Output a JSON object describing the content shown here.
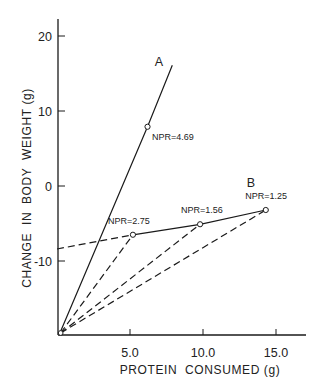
{
  "chart_data": {
    "type": "line",
    "title": "",
    "xlabel": "PROTEIN  CONSUMED (g)",
    "ylabel": "CHANGE  IN  BODY  WEIGHT (g)",
    "xlim": [
      0,
      17
    ],
    "ylim": [
      -20,
      22
    ],
    "grid": false,
    "legend": "none (series labelled inline)",
    "x_ticks": [
      {
        "value": 5,
        "label": "5.0"
      },
      {
        "value": 10,
        "label": "10.0"
      },
      {
        "value": 15,
        "label": "15.0"
      }
    ],
    "y_ticks": [
      {
        "value": 20,
        "label": "20"
      },
      {
        "value": 10,
        "label": "10"
      },
      {
        "value": 0,
        "label": "0"
      },
      {
        "value": -10,
        "label": "-10"
      }
    ],
    "origin_point": {
      "x": 0.25,
      "y": -19.6
    },
    "series": [
      {
        "name": "A",
        "style": "solid",
        "points": [
          {
            "x": 0.2,
            "y": -19.6
          },
          {
            "x": 6.2,
            "y": 7.9,
            "marker": true,
            "label": "NPR=4.69"
          },
          {
            "x": 7.9,
            "y": 16.1
          }
        ]
      },
      {
        "name": "B",
        "style": "solid",
        "points": [
          {
            "x": 5.2,
            "y": -6.5,
            "marker": true,
            "label": "NPR=2.75"
          },
          {
            "x": 9.8,
            "y": -5.1,
            "marker": true,
            "label": "NPR=1.56"
          },
          {
            "x": 14.3,
            "y": -3.2,
            "marker": true,
            "label": "NPR=1.25"
          }
        ]
      },
      {
        "name": "B extrapolation to y-axis",
        "style": "dashed",
        "points": [
          {
            "x": 0.0,
            "y": -8.4
          },
          {
            "x": 5.2,
            "y": -6.5
          }
        ]
      },
      {
        "name": "NPR ray 2.75",
        "style": "dashed",
        "points": [
          {
            "x": 0.25,
            "y": -19.6
          },
          {
            "x": 5.2,
            "y": -6.5
          }
        ]
      },
      {
        "name": "NPR ray 1.56",
        "style": "dashed",
        "points": [
          {
            "x": 0.25,
            "y": -19.6
          },
          {
            "x": 9.8,
            "y": -5.1
          }
        ]
      },
      {
        "name": "NPR ray 1.25",
        "style": "dashed",
        "points": [
          {
            "x": 0.25,
            "y": -19.6
          },
          {
            "x": 14.3,
            "y": -3.2
          }
        ]
      }
    ],
    "annotations": [
      {
        "text": "A",
        "x": 6.7,
        "y": 16.0
      },
      {
        "text": "B",
        "x": 13.0,
        "y": -0.1
      },
      {
        "text": "NPR=4.69",
        "x": 6.5,
        "y": 6.2
      },
      {
        "text": "NPR=2.75",
        "x": 3.5,
        "y": -5.0
      },
      {
        "text": "NPR=1.56",
        "x": 8.5,
        "y": -3.6
      },
      {
        "text": "NPR=1.25",
        "x": 12.9,
        "y": -1.7
      }
    ]
  }
}
